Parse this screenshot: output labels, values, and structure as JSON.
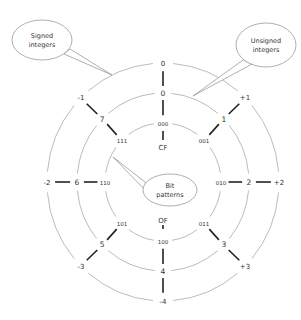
{
  "diagram": {
    "type": "concentric-ring number wheel",
    "center": {
      "x": 163,
      "y": 182
    },
    "rings": {
      "outer": {
        "name": "signed integers",
        "rx": 116,
        "ry": 119
      },
      "middle": {
        "name": "unsigned integers",
        "rx": 86,
        "ry": 89
      },
      "inner": {
        "name": "bit patterns",
        "rx": 58,
        "ry": 59
      }
    },
    "spokes": [
      {
        "angle": 0,
        "signed": "0",
        "unsigned": "0",
        "bits": "000"
      },
      {
        "angle": 45,
        "signed": "+1",
        "unsigned": "1",
        "bits": "001"
      },
      {
        "angle": 90,
        "signed": "+2",
        "unsigned": "2",
        "bits": "010"
      },
      {
        "angle": 135,
        "signed": "+3",
        "unsigned": "3",
        "bits": "011"
      },
      {
        "angle": 180,
        "signed": "-4",
        "unsigned": "4",
        "bits": "100"
      },
      {
        "angle": 225,
        "signed": "-3",
        "unsigned": "5",
        "bits": "101"
      },
      {
        "angle": 270,
        "signed": "-2",
        "unsigned": "6",
        "bits": "110"
      },
      {
        "angle": 315,
        "signed": "-1",
        "unsigned": "7",
        "bits": "111"
      }
    ],
    "flags": {
      "carry": {
        "label": "CF",
        "x": 163,
        "y": 148
      },
      "overflow": {
        "label": "OF",
        "x": 163,
        "y": 221
      }
    },
    "callouts": {
      "signed": {
        "line1": "Signed",
        "line2": "integers",
        "cx": 42,
        "cy": 40,
        "rx": 30,
        "ry": 20
      },
      "unsigned": {
        "line1": "Unsigned",
        "line2": "integers",
        "cx": 266,
        "cy": 45,
        "rx": 30,
        "ry": 22
      },
      "bits": {
        "line1": "Bit",
        "line2": "patterns",
        "cx": 170,
        "cy": 190,
        "rx": 27,
        "ry": 16
      }
    }
  }
}
